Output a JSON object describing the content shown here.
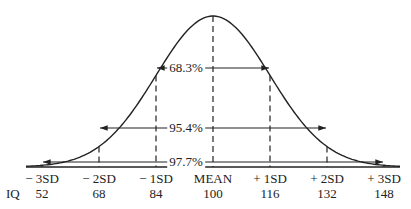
{
  "chart_data": {
    "type": "line",
    "title": "",
    "xlabel": "",
    "ylabel": "",
    "grid": false,
    "x_ticks": [
      "− 3SD",
      "− 2SD",
      "− 1SD",
      "MEAN",
      "+ 1SD",
      "+ 2SD",
      "+ 3SD"
    ],
    "iq_label": "IQ",
    "iq_values": [
      52,
      68,
      84,
      100,
      116,
      132,
      148
    ],
    "mean": 100,
    "sd": 16,
    "intervals": [
      {
        "label": "68.3%",
        "from": "− 1SD",
        "to": "+ 1SD"
      },
      {
        "label": "95.4%",
        "from": "− 2SD",
        "to": "+ 2SD"
      },
      {
        "label": "97.7%",
        "from": "− 3SD",
        "to": "+ 3SD"
      }
    ]
  }
}
